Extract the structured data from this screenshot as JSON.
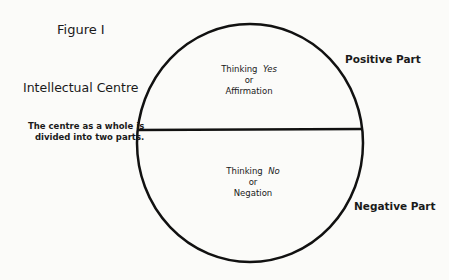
{
  "figure": {
    "title": "Figure I",
    "centre_label": "Intellectual Centre",
    "note_line1": "The centre as a whole is",
    "note_line2": "divided into two parts.",
    "positive_part_label": "Positive Part",
    "negative_part_label": "Negative Part",
    "upper_half": {
      "line1_prefix": "Thinking",
      "line1_emph": "Yes",
      "line2": "or",
      "line3": "Affirmation"
    },
    "lower_half": {
      "line1_prefix": "Thinking",
      "line1_emph": "No",
      "line2": "or",
      "line3": "Negation"
    }
  }
}
